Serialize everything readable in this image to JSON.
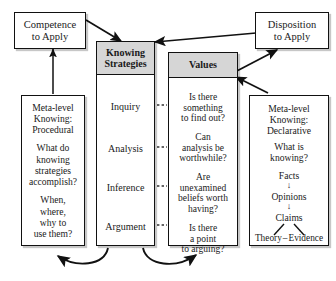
{
  "diagram": {
    "line_color": "#111111",
    "header_fill": "#d6d6d6",
    "box_fill": "#ffffff"
  },
  "top_boxes": {
    "competence": {
      "line1": "Competence",
      "line2": "to Apply"
    },
    "disposition": {
      "line1": "Disposition",
      "line2": "to Apply"
    }
  },
  "columns": {
    "knowing_strategies": {
      "header_line1": "Knowing",
      "header_line2": "Strategies",
      "items": [
        {
          "label": "Inquiry"
        },
        {
          "label": "Analysis"
        },
        {
          "label": "Inference"
        },
        {
          "label": "Argument"
        }
      ]
    },
    "values": {
      "header": "Values",
      "items": [
        {
          "line1": "Is there",
          "line2": "something",
          "line3": "to find out?"
        },
        {
          "line1": "Can",
          "line2": "analysis be",
          "line3": "worthwhile?"
        },
        {
          "line1": "Are",
          "line2": "unexamined",
          "line3": "beliefs worth",
          "line4": "having?"
        },
        {
          "line1": "Is there",
          "line2": "a point",
          "line3": "to arguing?"
        }
      ]
    }
  },
  "side_boxes": {
    "procedural": {
      "title_line1": "Meta-level",
      "title_line2": "Knowing:",
      "title_line3": "Procedural",
      "q1_line1": "What do",
      "q1_line2": "knowing",
      "q1_line3": "strategies",
      "q1_line4": "accomplish?",
      "q2_line1": "When,",
      "q2_line2": "where,",
      "q2_line3": "why to",
      "q2_line4": "use them?"
    },
    "declarative": {
      "title_line1": "Meta-level",
      "title_line2": "Knowing:",
      "title_line3": "Declarative",
      "q_line1": "What is",
      "q_line2": "knowing?",
      "chain": [
        {
          "label": "Facts"
        },
        {
          "label": "Opinions"
        },
        {
          "label": "Claims"
        }
      ],
      "arrow_glyph": "↓",
      "leaf_left": "Theory",
      "leaf_dash": "–",
      "leaf_right": "Evidence"
    }
  },
  "connectors": {
    "dashed_links": 4,
    "arrows": [
      {
        "name": "procedural-to-competence"
      },
      {
        "name": "competence-to-knowing-strategies"
      },
      {
        "name": "disposition-to-knowing-strategies"
      },
      {
        "name": "values-to-disposition"
      },
      {
        "name": "declarative-to-values"
      },
      {
        "name": "knowing-strategies-to-procedural"
      },
      {
        "name": "knowing-strategies-to-values"
      }
    ]
  }
}
